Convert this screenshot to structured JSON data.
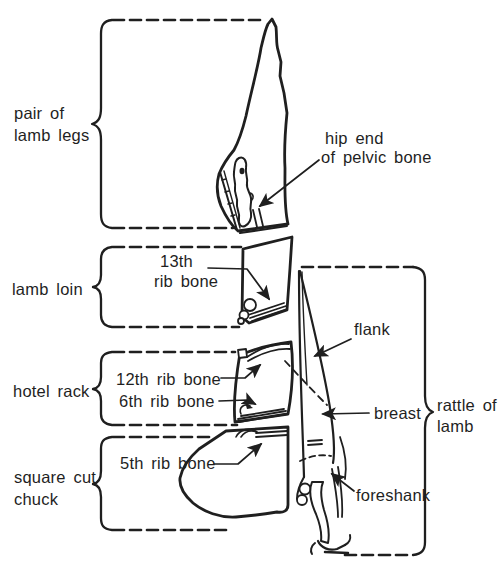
{
  "page": {
    "background": "#ffffff",
    "ink": "#1f1f1f"
  },
  "labels": {
    "legs_1": "pair of",
    "legs_2": "lamb legs",
    "loin": "lamb loin",
    "rack": "hotel rack",
    "chuck_1": "square cut",
    "chuck_2": "chuck",
    "rattle_1": "rattle of",
    "rattle_2": "lamb",
    "hip_1": "hip end",
    "hip_2": "of pelvic bone",
    "rib13_1": "13th",
    "rib13_2": "rib bone",
    "rib12": "12th rib bone",
    "rib6": "6th rib bone",
    "rib5": "5th rib bone",
    "flank": "flank",
    "breast": "breast",
    "foreshank": "foreshank"
  }
}
